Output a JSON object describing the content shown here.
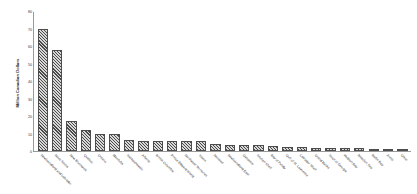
{
  "chart_data": {
    "type": "bar",
    "title": "",
    "subtitle": "",
    "xlabel": "",
    "ylabel": "Million Canadian Dollars",
    "ylim": [
      0,
      80
    ],
    "yticks": [
      0,
      10,
      20,
      30,
      40,
      50,
      60,
      70,
      80
    ],
    "ytick_labels": [
      "0",
      "10",
      "20",
      "30",
      "40",
      "50",
      "60",
      "70",
      "80"
    ],
    "grid": false,
    "legend": null,
    "legend_position": "none",
    "bar_fill": "diagonal-hatch",
    "bar_edge_color": "#4d4d4d",
    "bar_hatch_color": "#4a4a4a",
    "axis_color": "#9a9a9a",
    "background": "#ffffff",
    "categories": [
      "Newfoundland and Labrador",
      "Nova Scotia",
      "New Brunswick",
      "Quebec",
      "Ontario",
      "Manitoba",
      "Saskatchewan",
      "Alberta",
      "British Columbia",
      "Prince Edward Island",
      "Northwest Territories",
      "Yukon",
      "Nunavut",
      "Newfoundland East",
      "Gaspesie",
      "Scotian Shelf",
      "Bay of Fundy",
      "Gulf of St. Lawrence",
      "Labrador Shelf",
      "Grand Banks",
      "Strait of Georgia",
      "Hudson Bay",
      "Beaufort Sea",
      "Baffin Bay",
      "Arctic",
      "Other"
    ],
    "values": [
      70.2,
      58.1,
      17.2,
      12.1,
      9.8,
      9.6,
      6.2,
      6.0,
      5.9,
      5.8,
      5.6,
      5.5,
      4.3,
      3.5,
      3.4,
      3.2,
      3.1,
      2.4,
      2.1,
      2.0,
      1.9,
      1.8,
      1.7,
      1.0,
      0.9,
      0.8
    ]
  }
}
